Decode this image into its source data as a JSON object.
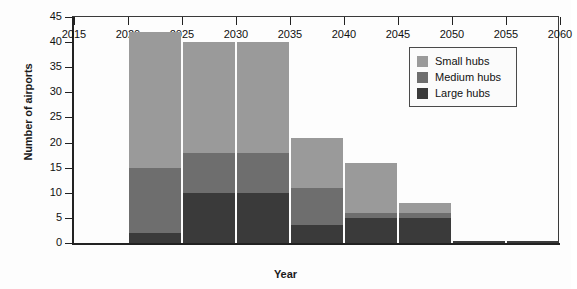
{
  "chart_data": {
    "type": "bar",
    "stacked": true,
    "title": "",
    "xlabel": "Year",
    "ylabel": "Number of airports",
    "xlim": [
      2015,
      2060
    ],
    "ylim": [
      0,
      45
    ],
    "ytick_step": 5,
    "xtick_step": 5,
    "grid": false,
    "legend_position": "upper right",
    "bar_interval": "Bars span the 5-year interval beginning at each category year",
    "xticks": [
      "2015",
      "2020",
      "2025",
      "2030",
      "2035",
      "2040",
      "2045",
      "2050",
      "2055",
      "2060"
    ],
    "yticks": [
      "0",
      "5",
      "10",
      "15",
      "20",
      "25",
      "30",
      "35",
      "40",
      "45"
    ],
    "categories": [
      2020,
      2025,
      2030,
      2035,
      2040,
      2045,
      2050,
      2055
    ],
    "series": [
      {
        "name": "Large hubs",
        "color": "#3a3a3a",
        "values": [
          2,
          10,
          10,
          3.5,
          5,
          5,
          0.5,
          0.5
        ]
      },
      {
        "name": "Medium hubs",
        "color": "#6e6e6e",
        "values": [
          13,
          8,
          8,
          7.5,
          1,
          1,
          0,
          0
        ]
      },
      {
        "name": "Small hubs",
        "color": "#9a9a9a",
        "values": [
          27,
          22,
          22,
          10,
          10,
          2,
          0,
          0
        ]
      }
    ],
    "totals": [
      42,
      40,
      40,
      21,
      16,
      8,
      0.5,
      0.5
    ]
  },
  "legend": {
    "entries": [
      {
        "label": "Small hubs",
        "color": "#9a9a9a"
      },
      {
        "label": "Medium hubs",
        "color": "#6e6e6e"
      },
      {
        "label": "Large hubs",
        "color": "#3a3a3a"
      }
    ]
  }
}
